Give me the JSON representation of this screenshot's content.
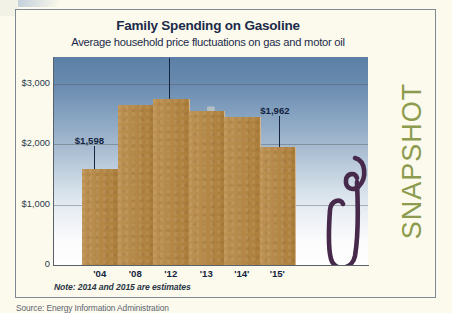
{
  "header": {
    "title": "Family Spending on Gasoline",
    "subtitle": "Average household price fluctuations on gas and motor oil"
  },
  "badge": {
    "label": "SNAPSHOT"
  },
  "note": "Note: 2014 and 2015 are estimates",
  "source": "Source: Energy Information Administration",
  "colors": {
    "bar": "#b5853f",
    "badge": "#8d9b4e",
    "title": "#1b2a4a",
    "nozzle": "#46294b",
    "plot_sky_top": "#5b7fa6",
    "plot_sky_bottom": "#ffffff"
  },
  "chart_data": {
    "type": "bar",
    "title": "Family Spending on Gasoline",
    "subtitle": "Average household price fluctuations on gas and motor oil",
    "xlabel": "",
    "ylabel": "",
    "categories": [
      "'04",
      "'08",
      "'12",
      "'13",
      "'14'",
      "'15'"
    ],
    "values": [
      1598,
      2660,
      2756,
      2560,
      2450,
      1962
    ],
    "value_labels": [
      "$1,598",
      "",
      "$2,756",
      "",
      "",
      "$1,962"
    ],
    "ylim": [
      0,
      3450
    ],
    "yticks": [
      0,
      1000,
      2000,
      3000
    ],
    "ytick_labels": [
      "0",
      "$1,000",
      "$2,000",
      "$3,000"
    ],
    "grid": true,
    "legend": "none",
    "annotations": [
      {
        "category": "'04",
        "text": "$1,598"
      },
      {
        "category": "'12",
        "text": "$2,756"
      },
      {
        "category": "'15'",
        "text": "$1,962"
      }
    ],
    "note": "Note: 2014 and 2015 are estimates",
    "source": "Source: Energy Information Administration"
  }
}
